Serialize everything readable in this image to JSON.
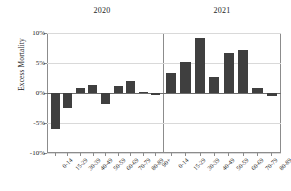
{
  "chart_data": {
    "type": "bar",
    "title": "",
    "xlabel": "",
    "ylabel": "Excess Mortality",
    "ylim": [
      -10,
      10
    ],
    "ytick_labels": [
      "10%",
      "5%",
      "0%",
      "-5%",
      "-10%"
    ],
    "ytick_values": [
      10,
      5,
      0,
      -5,
      -10
    ],
    "grid": true,
    "legend": "none",
    "panels": [
      {
        "label": "2020",
        "categories": [
          "0-14",
          "15-29",
          "30-39",
          "40-49",
          "50-59",
          "60-69",
          "70-79",
          "80-89",
          "90+"
        ],
        "values": [
          -6.0,
          -2.5,
          0.8,
          1.3,
          -1.8,
          1.1,
          2.0,
          0.2,
          -0.4
        ]
      },
      {
        "label": "2021",
        "categories": [
          "0-14",
          "15-29",
          "30-39",
          "40-49",
          "50-59",
          "60-69",
          "70-79",
          "80-89"
        ],
        "values": [
          3.4,
          5.1,
          9.2,
          2.7,
          6.7,
          7.2,
          0.9,
          -0.5
        ]
      }
    ],
    "colors": {
      "bar": "#3f3f3f",
      "grid": "#d9d9d9",
      "axis": "#8c8c8c",
      "zero_line": "#6b6b6b",
      "text": "#1c1c1c",
      "background": "#ffffff"
    }
  }
}
